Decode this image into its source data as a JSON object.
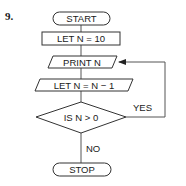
{
  "problem_number": "9.",
  "flowchart": {
    "start": {
      "label": "START",
      "shape": "terminator"
    },
    "init": {
      "label": "LET N = 10",
      "shape": "process"
    },
    "print": {
      "label": "PRINT N",
      "shape": "input-output"
    },
    "decrement": {
      "label": "LET N = N − 1",
      "shape": "input-output"
    },
    "decision": {
      "label": "IS N > 0",
      "shape": "decision"
    },
    "yes_label": "YES",
    "no_label": "NO",
    "stop": {
      "label": "STOP",
      "shape": "terminator"
    }
  },
  "colors": {
    "stroke": "#333333",
    "text": "#1a1a1a",
    "background": "#ffffff"
  }
}
